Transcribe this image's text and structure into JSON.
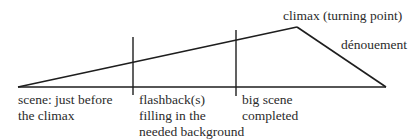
{
  "diagram": {
    "type": "plot structure (flashback narrative)",
    "labels": {
      "climax": "climax (turning point)",
      "denouement": "dénouement",
      "start_line1": "scene: just before",
      "start_line2": "the climax",
      "flashback_line1": "flashback(s)",
      "flashback_line2": "filling in the",
      "flashback_line3": "needed background",
      "bigscene_line1": "big scene",
      "bigscene_line2": "completed"
    },
    "line_color": "#1a1a1a"
  }
}
